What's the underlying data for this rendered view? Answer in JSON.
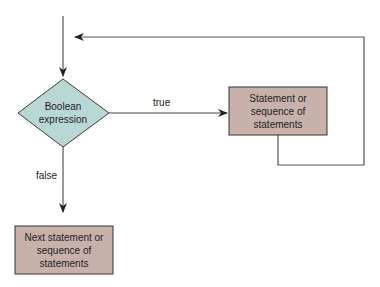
{
  "diagram": {
    "type": "flowchart",
    "title": "",
    "colors": {
      "decision_fill": "#b9d7d5",
      "process_fill": "#c9b1ab",
      "stroke": "#3a3a3a",
      "line": "#555555"
    },
    "nodes": {
      "decision": {
        "shape": "diamond",
        "label_line1": "Boolean",
        "label_line2": "expression"
      },
      "loop_body": {
        "shape": "rectangle",
        "label_line1": "Statement or",
        "label_line2": "sequence of",
        "label_line3": "statements"
      },
      "next": {
        "shape": "rectangle",
        "label_line1": "Next statement or",
        "label_line2": "sequence of",
        "label_line3": "statements"
      }
    },
    "edges": {
      "entry": {
        "from": "start",
        "to": "decision",
        "label": ""
      },
      "true_edge": {
        "from": "decision",
        "to": "loop_body",
        "label": "true"
      },
      "loop_back": {
        "from": "loop_body",
        "to": "decision",
        "label": ""
      },
      "false_edge": {
        "from": "decision",
        "to": "next",
        "label": "false"
      }
    }
  }
}
